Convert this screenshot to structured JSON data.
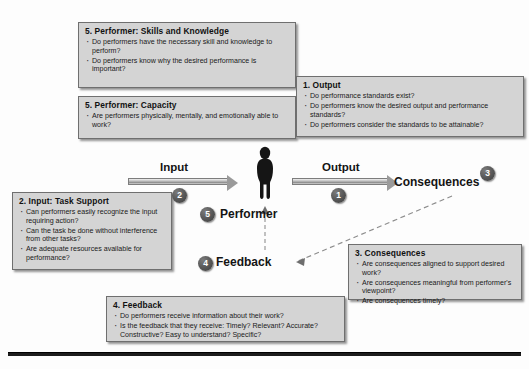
{
  "diagram": {
    "accent_color": "#d4d4d4",
    "border_color": "#6f6f6f",
    "badge_color": "#4a4a4a"
  },
  "flow": {
    "input_label": "Input",
    "output_label": "Output",
    "consequences_label": "Consequences",
    "performer_label": "Performer",
    "feedback_label": "Feedback",
    "badges": {
      "output": "1",
      "input": "2",
      "consequences": "3",
      "feedback": "4",
      "performer": "5"
    },
    "performer_icon": "person-silhouette-icon"
  },
  "panels": {
    "skills": {
      "title": "5. Performer: Skills and Knowledge",
      "bullets": [
        "Do performers have the necessary skill and knowledge to perform?",
        "Do performers know why the desired performance is important?"
      ]
    },
    "capacity": {
      "title": "5. Performer: Capacity",
      "bullets": [
        "Are performers physically, mentally, and emotionally able to work?"
      ]
    },
    "output": {
      "title": "1. Output",
      "bullets": [
        "Do performance standards exist?",
        "Do performers know the desired output and performance standards?",
        "Do performers consider the standards to be attainable?"
      ]
    },
    "input": {
      "title": "2. Input: Task Support",
      "bullets": [
        "Can performers easily recognize the input requiring action?",
        "Can the task be done without interference from other tasks?",
        "Are adequate resources available for performance?"
      ]
    },
    "consequences": {
      "title": "3. Consequences",
      "bullets": [
        "Are consequences aligned to support desired work?",
        "Are consequences meaningful from performer's viewpoint?",
        "Are consequences timely?"
      ]
    },
    "feedback": {
      "title": "4. Feedback",
      "bullets": [
        "Do performers receive information about their work?",
        "Is the feedback that they receive: Timely? Relevant? Accurate? Constructive? Easy to understand? Specific?"
      ]
    }
  }
}
